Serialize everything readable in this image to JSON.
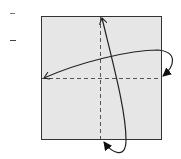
{
  "diagram": {
    "type": "origami-fold-step",
    "paper": {
      "fill": "#e6e6e6",
      "stroke": "#333333"
    },
    "fold_lines": [
      {
        "name": "vertical-valley-fold",
        "style": "dashed"
      },
      {
        "name": "horizontal-valley-fold",
        "style": "dashed"
      }
    ],
    "arrows": [
      {
        "name": "fold-right-to-left-arrow",
        "from": "right edge",
        "to": "left edge"
      },
      {
        "name": "fold-bottom-to-top-arrow",
        "from": "bottom edge",
        "to": "top edge"
      }
    ],
    "colors": {
      "line": "#222222",
      "dash": "#555555",
      "paper": "#e6e6e6"
    }
  }
}
